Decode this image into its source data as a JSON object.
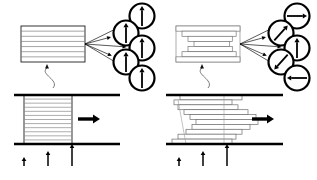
{
  "figure": {
    "panel_count": 2,
    "background_color": "#ffffff",
    "line_color": "#000000",
    "layer_color": "#8c8c8c"
  },
  "panels": [
    {
      "id": "left",
      "name": "aligned-state",
      "top_block": {
        "name": "ordered-layer-stack",
        "style": "aligned",
        "layer_count": 7,
        "x": 21,
        "y": 26,
        "w": 64,
        "h": 36
      },
      "leader": {
        "name": "block-leader-line",
        "from_x": 53,
        "from_y": 88,
        "to_x": 47,
        "to_y": 64
      },
      "fan_lines": 5,
      "orientation_circles": [
        {
          "name": "orientation-circle-1",
          "cx": 142,
          "cy": 16,
          "r": 12.5,
          "angle_deg": 90,
          "label": "up"
        },
        {
          "name": "orientation-circle-2",
          "cx": 126,
          "cy": 33,
          "r": 12.5,
          "angle_deg": 90,
          "label": "up"
        },
        {
          "name": "orientation-circle-3",
          "cx": 142,
          "cy": 48,
          "r": 12.5,
          "angle_deg": 90,
          "label": "up"
        },
        {
          "name": "orientation-circle-4",
          "cx": 126,
          "cy": 62,
          "r": 12.5,
          "angle_deg": 90,
          "label": "up"
        },
        {
          "name": "orientation-circle-5",
          "cx": 142,
          "cy": 78,
          "r": 12.5,
          "angle_deg": 90,
          "label": "up"
        }
      ],
      "shear_cell": {
        "name": "shear-cell-aligned",
        "top_plate": {
          "x1": 14,
          "y1": 95,
          "x2": 120,
          "y2": 95
        },
        "bottom_plate": {
          "x1": 14,
          "y1": 144,
          "x2": 120,
          "y2": 144
        },
        "block": {
          "x": 24,
          "y": 95,
          "w": 48,
          "h": 49,
          "layer_count": 12,
          "style": "aligned"
        },
        "shear_arrow": {
          "name": "shear-direction-arrow",
          "x": 78,
          "y": 119,
          "length": 22,
          "direction": "right"
        }
      },
      "velocity_profile": {
        "name": "velocity-profile-arrows",
        "arrows": [
          {
            "name": "velocity-arrow-small",
            "x": 24,
            "y": 166,
            "length": 9
          },
          {
            "name": "velocity-arrow-medium",
            "x": 48,
            "y": 166,
            "length": 15
          },
          {
            "name": "velocity-arrow-large",
            "x": 72,
            "y": 166,
            "length": 22
          }
        ]
      }
    },
    {
      "id": "right",
      "name": "sheared-state",
      "top_block": {
        "name": "staggered-layer-stack",
        "style": "staircase",
        "layer_count": 7,
        "x": 176,
        "y": 26,
        "w": 64,
        "h": 36
      },
      "leader": {
        "name": "block-leader-line",
        "from_x": 208,
        "from_y": 88,
        "to_x": 202,
        "to_y": 64
      },
      "fan_lines": 5,
      "orientation_circles": [
        {
          "name": "orientation-circle-1",
          "cx": 297,
          "cy": 16,
          "r": 12.5,
          "angle_deg": 0,
          "label": "right"
        },
        {
          "name": "orientation-circle-2",
          "cx": 281,
          "cy": 33,
          "r": 12.5,
          "angle_deg": 48,
          "label": "up-right"
        },
        {
          "name": "orientation-circle-3",
          "cx": 297,
          "cy": 48,
          "r": 12.5,
          "angle_deg": 90,
          "label": "up"
        },
        {
          "name": "orientation-circle-4",
          "cx": 281,
          "cy": 62,
          "r": 12.5,
          "angle_deg": 228,
          "label": "down-left"
        },
        {
          "name": "orientation-circle-5",
          "cx": 297,
          "cy": 78,
          "r": 12.5,
          "angle_deg": 180,
          "label": "left"
        }
      ],
      "shear_cell": {
        "name": "shear-cell-sheared",
        "top_plate": {
          "x1": 166,
          "y1": 95,
          "x2": 283,
          "y2": 95
        },
        "bottom_plate": {
          "x1": 166,
          "y1": 144,
          "x2": 283,
          "y2": 144
        },
        "block": {
          "x": 172,
          "y": 95,
          "w": 72,
          "h": 49,
          "layer_count": 10,
          "style": "staircase"
        },
        "shear_arrow": {
          "name": "shear-direction-arrow",
          "x": 252,
          "y": 119,
          "length": 22,
          "direction": "right"
        }
      },
      "velocity_profile": {
        "name": "velocity-profile-arrows",
        "arrows": [
          {
            "name": "velocity-arrow-small",
            "x": 179,
            "y": 166,
            "length": 9
          },
          {
            "name": "velocity-arrow-medium",
            "x": 203,
            "y": 166,
            "length": 15
          },
          {
            "name": "velocity-arrow-large",
            "x": 227,
            "y": 166,
            "length": 22
          }
        ]
      }
    }
  ]
}
